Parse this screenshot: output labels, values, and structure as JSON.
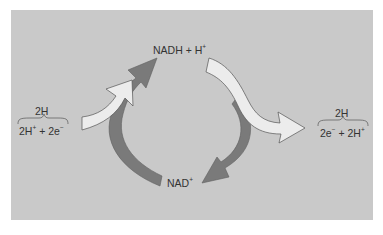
{
  "diagram": {
    "type": "NAD/NADH redox cycle",
    "colors": {
      "panel": "#c9c9c9",
      "cycle_arrow": "#7a7a7a",
      "hydrogen_arrow_fill": "#ececec",
      "hydrogen_arrow_stroke": "#555555",
      "text": "#333333"
    },
    "labels": {
      "top": {
        "main": "NADH + H",
        "sup": "+"
      },
      "bottom": {
        "main": "NAD",
        "sup": "+"
      },
      "left": {
        "over": "2H",
        "p1": "2H",
        "s1": "+",
        "p2": " + 2e",
        "s2": "−"
      },
      "right": {
        "over": "2H",
        "p1": "2e",
        "s1": "−",
        "p2": " + 2H",
        "s2": "+"
      }
    }
  }
}
